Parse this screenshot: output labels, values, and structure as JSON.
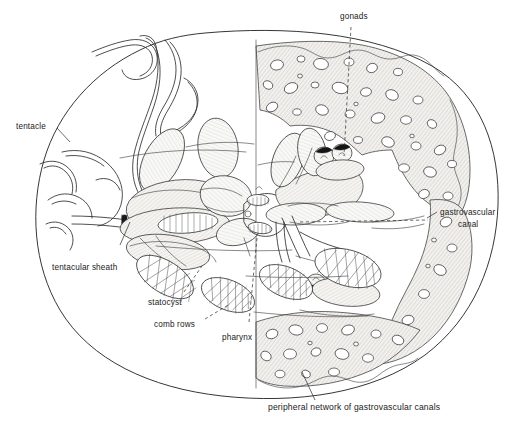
{
  "figure": {
    "background_color": "#ffffff",
    "ink_color": "#2e2e2e",
    "width": 520,
    "height": 424
  },
  "labels": {
    "tentacle": "tentacle",
    "tentacular_sheath": "tentacular sheath",
    "statocyst": "statocyst",
    "comb_rows": "comb rows",
    "pharynx": "pharynx",
    "gonads": "gonads",
    "gastrovascular_canal_line1": "gastrovascular",
    "gastrovascular_canal_line2": "canal",
    "peripheral_network": "peripheral network of gastrovascular canals"
  },
  "structures": [
    {
      "name": "body-outline",
      "description": "broad oval body wall of the comb jelly"
    },
    {
      "name": "tentacle",
      "description": "long coiled ribbon-like tentacle emerging upper left"
    },
    {
      "name": "tentacular-sheath",
      "description": "tubular sheath housing the retracted tentacle base"
    },
    {
      "name": "statocyst",
      "description": "apical sense organ"
    },
    {
      "name": "comb-rows",
      "description": "cross-hatched ctene plate rows, eight arranged meridionally"
    },
    {
      "name": "pharynx",
      "description": "central pharynx / stomodeum"
    },
    {
      "name": "gonads",
      "description": "paired dark gonad bodies along the meridional canals"
    },
    {
      "name": "gastrovascular-canal",
      "description": "canal running beneath the body wall"
    },
    {
      "name": "peripheral-network",
      "description": "shaded porous meshwork of peripheral gastrovascular canals"
    }
  ]
}
